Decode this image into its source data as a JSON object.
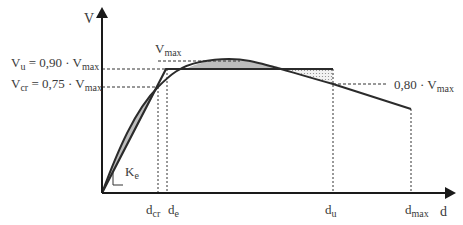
{
  "diagram": {
    "type": "force-displacement bilinear idealization",
    "axes": {
      "y_label": "V",
      "x_label": "d"
    },
    "y_labels": {
      "vmax": {
        "main": "V",
        "sub": "max"
      },
      "vu": {
        "main": "V",
        "sub": "u",
        "eq": " = 0,90 · V",
        "eq_sub": "max"
      },
      "vcr": {
        "main": "V",
        "sub": "cr",
        "eq": " = 0,75 · V",
        "eq_sub": "max"
      },
      "v080": {
        "main": "0,80 · V",
        "sub": "max"
      }
    },
    "x_labels": {
      "dcr": {
        "main": "d",
        "sub": "cr"
      },
      "de": {
        "main": "d",
        "sub": "e"
      },
      "du": {
        "main": "d",
        "sub": "u"
      },
      "dmax": {
        "main": "d",
        "sub": "max"
      }
    },
    "stiffness_label": {
      "main": "K",
      "sub": "e"
    },
    "colors": {
      "line": "#2b2b2b",
      "fill": "#bdbdbd",
      "dotfill": "#d9d9d9"
    }
  }
}
